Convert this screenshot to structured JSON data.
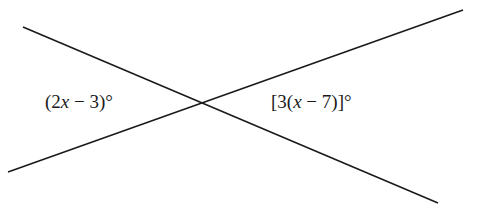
{
  "diagram": {
    "type": "intersecting-lines",
    "line_color": "#1a1a1a",
    "lines": [
      {
        "name": "line-descending",
        "x1": 23,
        "y1": 27,
        "x2": 438,
        "y2": 203
      },
      {
        "name": "line-ascending",
        "x1": 8,
        "y1": 172,
        "x2": 463,
        "y2": 10
      }
    ],
    "intersection": {
      "x": 202,
      "y": 103
    },
    "labels": {
      "left_angle": {
        "pre": "(2",
        "var": "x",
        "post": " − 3)°"
      },
      "right_angle": {
        "pre": "[3(",
        "var": "x",
        "post": " − 7)]°"
      }
    }
  }
}
